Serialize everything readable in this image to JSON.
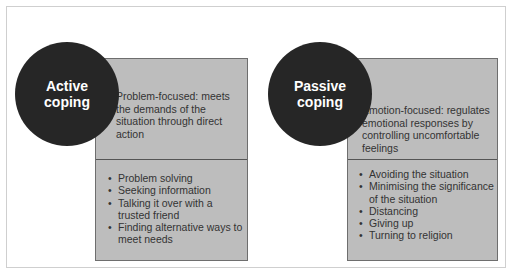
{
  "left": {
    "title_line1": "Active",
    "title_line2": "coping",
    "description": "Problem-focused: meets the demands of the situation through direct action",
    "items": [
      "Problem solving",
      "Seeking information",
      "Talking it over with a trusted friend",
      "Finding alternative ways to meet needs"
    ]
  },
  "right": {
    "title_line1": "Passive",
    "title_line2": "coping",
    "description": "Emotion-focused: regulates emotional responses by controlling uncomfortable feelings",
    "items": [
      "Avoiding the situation",
      "Minimising the significance of the situation",
      "Distancing",
      "Giving up",
      "Turning to religion"
    ]
  },
  "colors": {
    "circle": "#262626",
    "box": "#bdbdbd"
  }
}
